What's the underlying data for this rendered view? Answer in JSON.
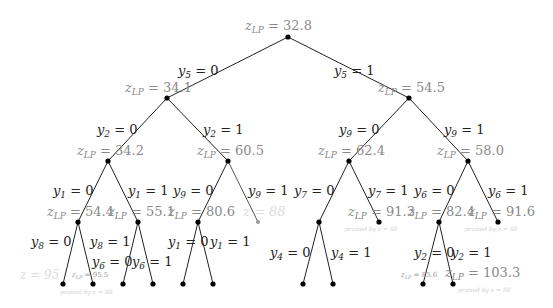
{
  "diagram": {
    "type": "branch-and-bound-tree",
    "nodes": [
      {
        "id": "root",
        "x": 288,
        "y": 37,
        "label": "z_LP = 32.8",
        "style": "normal"
      },
      {
        "id": "n5_0",
        "x": 167,
        "y": 98,
        "label": "z_LP = 34.1",
        "style": "normal"
      },
      {
        "id": "n5_1",
        "x": 409,
        "y": 98,
        "label": "z_LP = 54.5",
        "style": "normal"
      },
      {
        "id": "n2_0",
        "x": 108,
        "y": 161,
        "label": "z_LP = 34.2",
        "style": "normal"
      },
      {
        "id": "n2_1",
        "x": 228,
        "y": 161,
        "label": "z_LP = 60.5",
        "style": "normal"
      },
      {
        "id": "n9_0",
        "x": 349,
        "y": 161,
        "label": "z_LP = 62.4",
        "style": "normal"
      },
      {
        "id": "n9_1",
        "x": 468,
        "y": 161,
        "label": "z_LP = 58.0",
        "style": "normal"
      },
      {
        "id": "n1_0",
        "x": 78,
        "y": 222,
        "label": "z_LP = 54.4",
        "style": "normal"
      },
      {
        "id": "n1_1",
        "x": 138,
        "y": 222,
        "label": "z_LP = 55.1",
        "style": "normal"
      },
      {
        "id": "n9b_0",
        "x": 198,
        "y": 222,
        "label": "z_LP = 80.6",
        "style": "normal"
      },
      {
        "id": "n9b_1",
        "x": 258,
        "y": 222,
        "label": "z = 88",
        "style": "faint"
      },
      {
        "id": "n7_0",
        "x": 319,
        "y": 222,
        "label": "",
        "style": "normal"
      },
      {
        "id": "n7_1",
        "x": 379,
        "y": 222,
        "label": "z_LP = 91.3",
        "style": "normal"
      },
      {
        "id": "n6_0",
        "x": 439,
        "y": 222,
        "label": "z_LP = 82.4",
        "style": "normal"
      },
      {
        "id": "n6_1",
        "x": 498,
        "y": 222,
        "label": "z_LP = 91.6",
        "style": "normal"
      }
    ],
    "edges": [
      {
        "from": "root",
        "to": "n5_0",
        "label": "y5 = 0"
      },
      {
        "from": "root",
        "to": "n5_1",
        "label": "y5 = 1"
      },
      {
        "from": "n5_0",
        "to": "n2_0",
        "label": "y2 = 0"
      },
      {
        "from": "n5_0",
        "to": "n2_1",
        "label": "y2 = 1"
      },
      {
        "from": "n5_1",
        "to": "n9_0",
        "label": "y9 = 0"
      },
      {
        "from": "n5_1",
        "to": "n9_1",
        "label": "y9 = 1"
      },
      {
        "from": "n2_0",
        "to": "n1_0",
        "label": "y1 = 0"
      },
      {
        "from": "n2_0",
        "to": "n1_1",
        "label": "y1 = 1"
      },
      {
        "from": "n2_1",
        "to": "n9b_0",
        "label": "y9 = 0"
      },
      {
        "from": "n2_1",
        "to": "n9b_1",
        "label": "y9 = 1"
      },
      {
        "from": "n9_0",
        "to": "n7_0",
        "label": "y7 = 0"
      },
      {
        "from": "n9_0",
        "to": "n7_1",
        "label": "y7 = 1"
      },
      {
        "from": "n9_1",
        "to": "n6_0",
        "label": "y6 = 0"
      },
      {
        "from": "n9_1",
        "to": "n6_1",
        "label": "y6 = 1"
      },
      {
        "from": "n1_0",
        "to": "leaf1",
        "label": "y8 = 0"
      },
      {
        "from": "n1_0",
        "to": "leaf2",
        "label": "y8 = 1"
      },
      {
        "from": "n1_1",
        "to": "leaf3",
        "label": "y6 = 0"
      },
      {
        "from": "n1_1",
        "to": "leaf4",
        "label": "y6 = 1"
      },
      {
        "from": "n9b_0",
        "to": "leaf5",
        "label": "y1 = 0"
      },
      {
        "from": "n9b_0",
        "to": "leaf6",
        "label": "y1 = 1"
      },
      {
        "from": "n7_0",
        "to": "leaf7",
        "label": "y4 = 0"
      },
      {
        "from": "n7_0",
        "to": "leaf8",
        "label": "y4 = 1"
      },
      {
        "from": "n6_0",
        "to": "leaf9",
        "label": "y2 = 0"
      },
      {
        "from": "n6_0",
        "to": "leaf10",
        "label": "y2 = 1"
      }
    ],
    "leaf_labels": {
      "leaf1": "z = 95",
      "leaf2": "z_LP = 95.5",
      "leaf9": "z_LP = 85.6",
      "leaf10": "z_LP = 103.3"
    },
    "pruned_notes": [
      "pruned by z = 88",
      "pruned by z = 88",
      "pruned by z = 88",
      "pruned by z = 88"
    ]
  },
  "labels": {
    "root": "z",
    "sub": "LP",
    "eq_root": " = 32.8",
    "eq_34_1": " = 34.1",
    "eq_54_5": " = 54.5",
    "eq_34_2": " = 34.2",
    "eq_60_5": " = 60.5",
    "eq_62_4": " = 62.4",
    "eq_58_0": " = 58.0",
    "eq_54_4": " = 54.4",
    "eq_55_1": " = 55.1",
    "eq_80_6": " = 80.6",
    "eq_91_3": " = 91.3",
    "eq_82_4": " = 82.4",
    "eq_91_6": " = 91.6",
    "eq_95_5": " = 95.5",
    "eq_85_6": " = 85.6",
    "eq_103_3": " = 103.3",
    "z88": "z = 88",
    "z95": "z = 95",
    "pruned": "pruned by z = 88",
    "y": "y",
    "eq0": " = 0",
    "eq1": " = 1",
    "s1": "1",
    "s2": "2",
    "s4": "4",
    "s5": "5",
    "s6": "6",
    "s7": "7",
    "s8": "8",
    "s9": "9"
  }
}
